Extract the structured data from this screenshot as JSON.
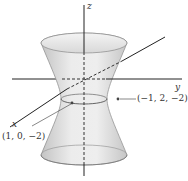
{
  "figure": {
    "type": "hyperboloid-of-one-sheet",
    "axes": {
      "x_label": "x",
      "y_label": "y",
      "z_label": "z"
    },
    "points": [
      {
        "label": "(1, 0, −2)",
        "coords": [
          1,
          0,
          -2
        ]
      },
      {
        "label": "(−1, 2, −2)",
        "coords": [
          -1,
          2,
          -2
        ]
      }
    ],
    "colors": {
      "surface_fill": "#e4e4e4",
      "surface_shade": "#c8c8c8",
      "axis": "#222222",
      "leader": "#555555"
    }
  }
}
